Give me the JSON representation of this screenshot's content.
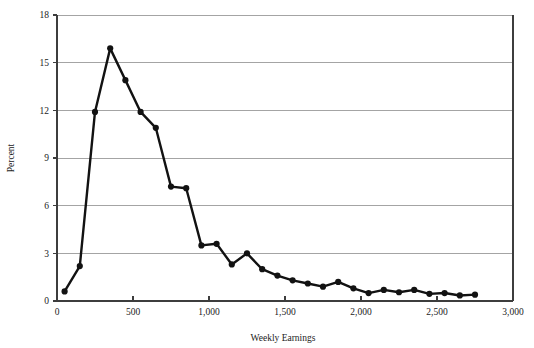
{
  "chart_data": {
    "type": "line",
    "title": "",
    "xlabel": "Weekly Earnings",
    "ylabel": "Percent",
    "xlim": [
      0,
      3000
    ],
    "ylim": [
      0,
      18
    ],
    "xticks": [
      0,
      500,
      1000,
      1500,
      2000,
      2500,
      3000
    ],
    "xtick_labels": [
      "0",
      "500",
      "1,000",
      "1,500",
      "2,000",
      "2,500",
      "3,000"
    ],
    "yticks": [
      0,
      3,
      6,
      9,
      12,
      15,
      18
    ],
    "ytick_labels": [
      "0",
      "3",
      "6",
      "9",
      "12",
      "15",
      "18"
    ],
    "grid": "horizontal",
    "legend": "none",
    "marker": "filled-circle",
    "series": [
      {
        "name": "Percent of workers",
        "x": [
          50,
          150,
          250,
          350,
          450,
          550,
          650,
          750,
          850,
          950,
          1050,
          1150,
          1250,
          1350,
          1450,
          1550,
          1650,
          1750,
          1850,
          1950,
          2050,
          2150,
          2250,
          2350,
          2450,
          2550,
          2650,
          2750
        ],
        "values": [
          0.6,
          2.2,
          11.9,
          15.9,
          13.9,
          11.9,
          10.9,
          7.2,
          7.1,
          3.5,
          3.6,
          2.3,
          3.0,
          2.0,
          1.6,
          1.3,
          1.1,
          0.9,
          1.2,
          0.8,
          0.5,
          0.7,
          0.55,
          0.7,
          0.45,
          0.5,
          0.35,
          0.4
        ]
      }
    ]
  },
  "figure": {
    "x_axis_title": "Weekly Earnings",
    "y_axis_title": "Percent"
  }
}
